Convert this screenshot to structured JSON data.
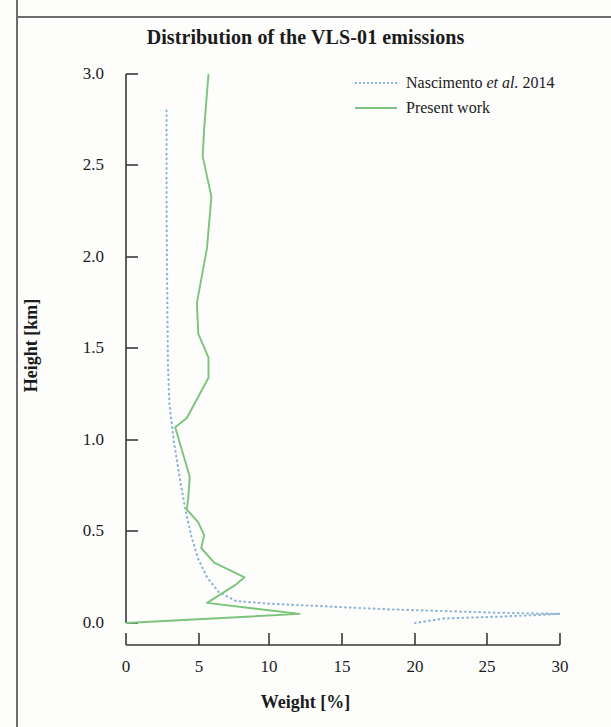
{
  "figure": {
    "title": "Distribution of the VLS-01 emissions",
    "x_axis_label": "Weight [%]",
    "y_axis_label": "Height [km]"
  },
  "legend": {
    "position": "top-right",
    "items": [
      {
        "label_pre": "Nascimento ",
        "label_em": "et al.",
        "label_post": " 2014",
        "style": "dotted",
        "color": "#8fb4d8"
      },
      {
        "label_pre": "Present work",
        "label_em": "",
        "label_post": "",
        "style": "solid",
        "color": "#7cc47c"
      }
    ]
  },
  "axes": {
    "x_ticks": [
      "0",
      "5",
      "10",
      "15",
      "20",
      "25",
      "30"
    ],
    "y_ticks": [
      "3.0",
      "2.5",
      "2.0",
      "1.5",
      "1.0",
      "0.5",
      "0.0"
    ]
  },
  "colors": {
    "nascimento": "#8fb4d8",
    "present_work": "#7cc47c",
    "axis": "#3a3a3a",
    "text": "#1b1b1b",
    "frame": "#6e6e6e",
    "background": "#fdfdfc"
  },
  "chart_data": {
    "type": "line",
    "title": "Distribution of the VLS-01 emissions",
    "xlabel": "Weight [%]",
    "ylabel": "Height [km]",
    "xlim": [
      0,
      30
    ],
    "ylim": [
      0,
      3.0
    ],
    "xticks": [
      0,
      5,
      10,
      15,
      20,
      25,
      30
    ],
    "yticks": [
      0.0,
      0.5,
      1.0,
      1.5,
      2.0,
      2.5,
      3.0
    ],
    "grid": false,
    "legend_position": "upper right",
    "orientation": "vertical-profile",
    "note": "x = Weight [%], y = Height [km]; each series is a list of [weight, height] points",
    "series": [
      {
        "name": "Nascimento et al. 2014",
        "style": "dotted",
        "color": "#8fb4d8",
        "points": [
          [
            2.8,
            2.8
          ],
          [
            2.8,
            2.3
          ],
          [
            2.85,
            1.8
          ],
          [
            2.9,
            1.4
          ],
          [
            3.0,
            1.2
          ],
          [
            3.3,
            1.0
          ],
          [
            3.7,
            0.8
          ],
          [
            4.1,
            0.62
          ],
          [
            4.5,
            0.48
          ],
          [
            5.0,
            0.35
          ],
          [
            5.6,
            0.25
          ],
          [
            6.4,
            0.17
          ],
          [
            7.6,
            0.12
          ],
          [
            10.0,
            0.105
          ],
          [
            14.0,
            0.09
          ],
          [
            18.0,
            0.075
          ],
          [
            22.0,
            0.065
          ],
          [
            26.0,
            0.055
          ],
          [
            30.0,
            0.05
          ],
          [
            26.0,
            0.035
          ],
          [
            22.0,
            0.025
          ],
          [
            20.0,
            0.0
          ]
        ]
      },
      {
        "name": "Present work",
        "style": "solid",
        "color": "#7cc47c",
        "points": [
          [
            5.7,
            3.0
          ],
          [
            5.4,
            2.7
          ],
          [
            5.3,
            2.55
          ],
          [
            5.9,
            2.33
          ],
          [
            5.6,
            2.05
          ],
          [
            4.9,
            1.75
          ],
          [
            5.0,
            1.58
          ],
          [
            5.7,
            1.45
          ],
          [
            5.7,
            1.34
          ],
          [
            4.2,
            1.12
          ],
          [
            3.4,
            1.07
          ],
          [
            4.4,
            0.8
          ],
          [
            4.3,
            0.68
          ],
          [
            4.2,
            0.62
          ],
          [
            5.0,
            0.55
          ],
          [
            5.4,
            0.48
          ],
          [
            5.2,
            0.41
          ],
          [
            6.1,
            0.33
          ],
          [
            8.2,
            0.25
          ],
          [
            7.6,
            0.21
          ],
          [
            5.6,
            0.11
          ],
          [
            12.0,
            0.05
          ],
          [
            0.0,
            0.0
          ]
        ]
      }
    ]
  }
}
